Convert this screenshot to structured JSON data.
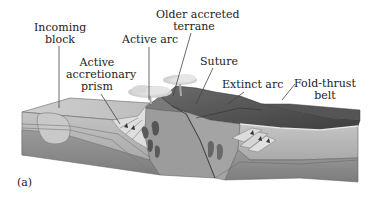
{
  "figure": {
    "caption": "(a)"
  },
  "labels": {
    "incoming_block": {
      "line1": "Incoming",
      "line2": "block"
    },
    "active_arc": {
      "line1": "Active arc"
    },
    "older_terrane": {
      "line1": "Older accreted",
      "line2": "terrane"
    },
    "suture": {
      "line1": "Suture"
    },
    "accretionary_prism": {
      "line1": "Active",
      "line2": "accretionary",
      "line3": "prism"
    },
    "extinct_arc": {
      "line1": "Extinct arc"
    },
    "fold_thrust": {
      "line1": "Fold-thrust",
      "line2": "belt"
    }
  },
  "colors": {
    "background": "#ffffff",
    "text": "#222222",
    "leader_line": "#444444",
    "top_surface_light": "#c8c8c8",
    "upper_layer": "#b4b4b4",
    "lower_layer": "#8e8e8e",
    "mountain_dark": "#4a4a4a",
    "magma": "#5a5a5a",
    "cloud": "#e0e0e0"
  }
}
